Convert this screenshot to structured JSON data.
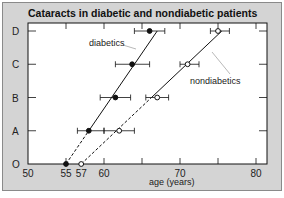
{
  "chart_data": {
    "type": "scatter",
    "title": "Cataracts in diabetic and nondiabetic patients",
    "xlabel": "age (years)",
    "ylabel": "",
    "xlim": [
      50,
      81
    ],
    "x_ticks": [
      50,
      55,
      57,
      60,
      70,
      80
    ],
    "x_minor_ticks": [
      55,
      60,
      65,
      70,
      75,
      80
    ],
    "categories": [
      "O",
      "A",
      "B",
      "C",
      "D"
    ],
    "grid": false,
    "series": [
      {
        "name": "diabetics",
        "marker": "filled-circle",
        "points": [
          {
            "category": "O",
            "x": 55,
            "err_low": null,
            "err_high": null
          },
          {
            "category": "A",
            "x": 58,
            "err_low": 56.5,
            "err_high": 60
          },
          {
            "category": "B",
            "x": 61.5,
            "err_low": 59.5,
            "err_high": 63.5
          },
          {
            "category": "C",
            "x": 63.7,
            "err_low": 61.5,
            "err_high": 66
          },
          {
            "category": "D",
            "x": 66,
            "err_low": 64,
            "err_high": 68
          }
        ],
        "fit_line": {
          "from": {
            "x": 55,
            "category": "O"
          },
          "to": {
            "x": 67,
            "category": "D"
          }
        },
        "dashed_segment_until": "A"
      },
      {
        "name": "nondiabetics",
        "marker": "open-circle",
        "points": [
          {
            "category": "O",
            "x": 57,
            "err_low": null,
            "err_high": null
          },
          {
            "category": "A",
            "x": 62,
            "err_low": 60,
            "err_high": 64
          },
          {
            "category": "B",
            "x": 67,
            "err_low": 65.5,
            "err_high": 68.5
          },
          {
            "category": "C",
            "x": 71,
            "err_low": 70,
            "err_high": 72.5
          },
          {
            "category": "D",
            "x": 75,
            "err_low": 74,
            "err_high": 76.5
          }
        ],
        "fit_line": {
          "from": {
            "x": 57,
            "category": "O"
          },
          "to": {
            "x": 75.5,
            "category": "D"
          }
        },
        "dashed_segment_until": "B"
      }
    ],
    "annotations": [
      {
        "text": "diabetics",
        "points_to": "diabetics"
      },
      {
        "text": "nondiabetics",
        "points_to": "nondiabetics"
      }
    ]
  },
  "colors": {
    "background": "#d4d4d4",
    "plot_bg": "#ffffff",
    "ink": "#111111",
    "leader": "#999999"
  }
}
